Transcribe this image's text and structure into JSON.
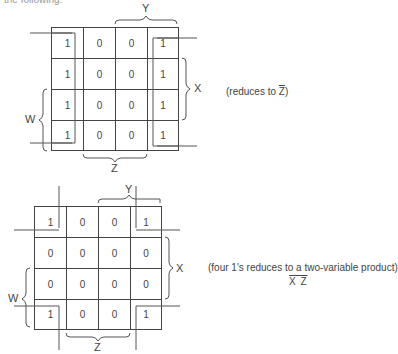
{
  "header": {
    "text": "the following:"
  },
  "maps": [
    {
      "id": "top",
      "cells": [
        [
          "1",
          "0",
          "0",
          "1"
        ],
        [
          "1",
          "0",
          "0",
          "1"
        ],
        [
          "1",
          "0",
          "0",
          "1"
        ],
        [
          "1",
          "0",
          "0",
          "1"
        ]
      ],
      "labels": {
        "top": "Y",
        "right": "X",
        "left": "W",
        "bottom": "Z"
      },
      "note": {
        "prefix": "(reduces to ",
        "expr": "Z",
        "suffix": ")"
      }
    },
    {
      "id": "bottom",
      "cells": [
        [
          "1",
          "0",
          "0",
          "1"
        ],
        [
          "0",
          "0",
          "0",
          "0"
        ],
        [
          "0",
          "0",
          "0",
          "0"
        ],
        [
          "1",
          "0",
          "0",
          "1"
        ]
      ],
      "labels": {
        "top": "Y",
        "right": "X",
        "left": "W",
        "bottom": "Z"
      },
      "note": {
        "line1": "(four 1's reduces to a two-variable product)",
        "expr": "X Z"
      }
    }
  ]
}
